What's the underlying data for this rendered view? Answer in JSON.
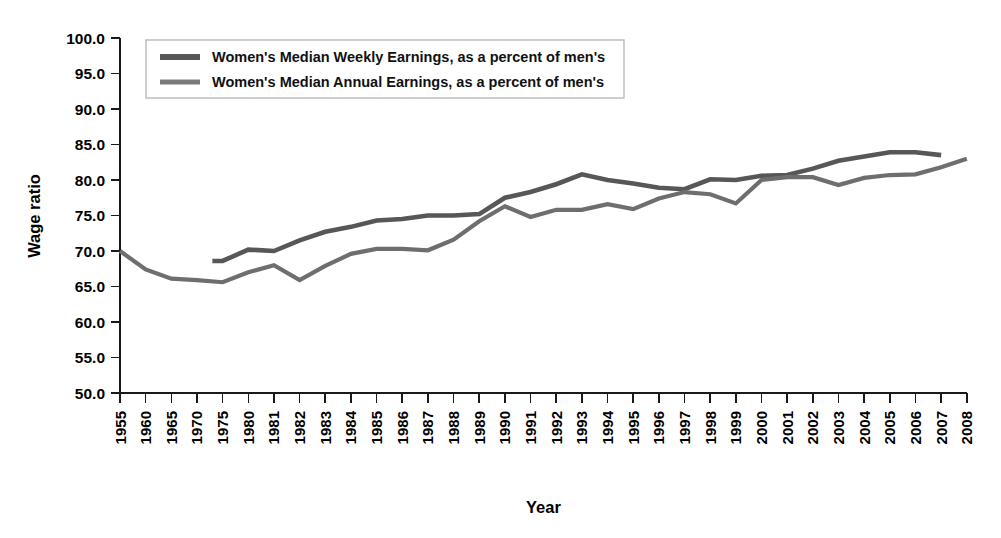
{
  "chart_data": {
    "type": "line",
    "title": "",
    "xlabel": "Year",
    "ylabel": "Wage ratio",
    "ylim": [
      50.0,
      100.0
    ],
    "ytick_labels": [
      "100.0",
      "95.0",
      "90.0",
      "85.0",
      "80.0",
      "75.0",
      "70.0",
      "65.0",
      "60.0",
      "55.0",
      "50.0"
    ],
    "ytick_values": [
      100.0,
      95.0,
      90.0,
      85.0,
      80.0,
      75.0,
      70.0,
      65.0,
      60.0,
      55.0,
      50.0
    ],
    "grid": false,
    "legend_position": "top-left-inside",
    "categories": [
      "1955",
      "1960",
      "1965",
      "1970",
      "1975",
      "1980",
      "1981",
      "1982",
      "1983",
      "1984",
      "1985",
      "1986",
      "1987",
      "1988",
      "1989",
      "1990",
      "1991",
      "1992",
      "1993",
      "1994",
      "1995",
      "1996",
      "1997",
      "1998",
      "1999",
      "2000",
      "2001",
      "2002",
      "2003",
      "2004",
      "2005",
      "2006",
      "2007",
      "2008"
    ],
    "series": [
      {
        "name": "Women's Median Weekly Earnings, as a percent of men's",
        "color": "#575757",
        "x": [
          "1973",
          "1975",
          "1980",
          "1981",
          "1982",
          "1983",
          "1984",
          "1985",
          "1986",
          "1987",
          "1988",
          "1989",
          "1990",
          "1991",
          "1992",
          "1993",
          "1994",
          "1995",
          "1996",
          "1997",
          "1998",
          "1999",
          "2000",
          "2001",
          "2002",
          "2003",
          "2004",
          "2005",
          "2006",
          "2007"
        ],
        "values": [
          68.6,
          68.6,
          70.2,
          70.0,
          71.5,
          72.7,
          73.4,
          74.3,
          74.5,
          75.0,
          75.0,
          75.2,
          77.5,
          78.3,
          79.4,
          80.8,
          80.0,
          79.5,
          78.9,
          78.7,
          80.1,
          80.0,
          80.6,
          80.7,
          81.6,
          82.7,
          83.3,
          83.9,
          83.9,
          83.5
        ]
      },
      {
        "name": "Women's Median Annual Earnings, as a percent of men's",
        "color": "#6e6e6e",
        "x": [
          "1955",
          "1960",
          "1965",
          "1970",
          "1975",
          "1980",
          "1981",
          "1982",
          "1983",
          "1984",
          "1985",
          "1986",
          "1987",
          "1988",
          "1989",
          "1990",
          "1991",
          "1992",
          "1993",
          "1994",
          "1995",
          "1996",
          "1997",
          "1998",
          "1999",
          "2000",
          "2001",
          "2002",
          "2003",
          "2004",
          "2005",
          "2006",
          "2007",
          "2008"
        ],
        "values": [
          70.0,
          67.4,
          66.1,
          65.9,
          65.6,
          67.0,
          68.0,
          65.9,
          67.9,
          69.6,
          70.3,
          70.3,
          70.1,
          71.6,
          74.2,
          76.3,
          74.8,
          75.8,
          75.8,
          76.6,
          75.9,
          77.4,
          78.3,
          78.0,
          76.7,
          80.0,
          80.4,
          80.4,
          79.3,
          80.3,
          80.7,
          80.8,
          81.8,
          83.0
        ]
      }
    ],
    "legend": [
      {
        "label": "Women's Median Weekly Earnings, as a percent of men's",
        "color": "#575757",
        "swatch_width": 6.0
      },
      {
        "label": "Women's Median Annual Earnings, as a percent of men's",
        "color": "#7a7a7a",
        "swatch_width": 5.0
      }
    ]
  }
}
